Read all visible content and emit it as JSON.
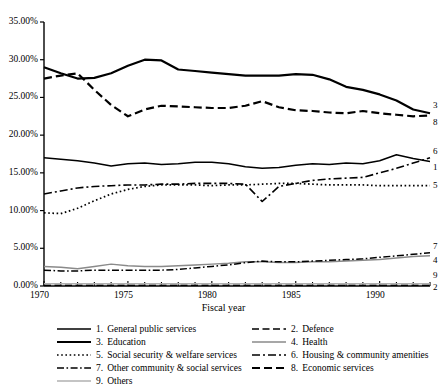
{
  "chart_data": {
    "type": "line",
    "title": "",
    "xlabel": "Fiscal year",
    "ylabel": "",
    "x": [
      1970,
      1971,
      1972,
      1973,
      1974,
      1975,
      1976,
      1977,
      1978,
      1979,
      1980,
      1981,
      1982,
      1983,
      1984,
      1985,
      1986,
      1987,
      1988,
      1989,
      1990,
      1991,
      1992,
      1993
    ],
    "xlim": [
      1970,
      1993
    ],
    "ylim": [
      0,
      35
    ],
    "ytick_labels": [
      "0.00%",
      "5.00%",
      "10.00%",
      "15.00%",
      "20.00%",
      "25.00%",
      "30.00%",
      "35.00%"
    ],
    "ytick_values": [
      0,
      5,
      10,
      15,
      20,
      25,
      30,
      35
    ],
    "xtick_labels": [
      "1970",
      "1975",
      "1980",
      "1985",
      "1990"
    ],
    "xtick_values": [
      1970,
      1975,
      1980,
      1985,
      1990
    ],
    "grid": false,
    "legend_position": "below",
    "series": [
      {
        "name": "General public services",
        "number": "1",
        "style": "solid",
        "end_label": "1",
        "values": [
          17.0,
          16.8,
          16.6,
          16.3,
          15.9,
          16.2,
          16.3,
          16.1,
          16.2,
          16.4,
          16.4,
          16.2,
          15.8,
          15.6,
          15.7,
          16.0,
          16.2,
          16.1,
          16.3,
          16.2,
          16.6,
          17.4,
          16.9,
          16.5
        ]
      },
      {
        "name": "Defence",
        "number": "2",
        "style": "dashed",
        "end_label": "2",
        "values": [
          0.1,
          0.1,
          0.1,
          0.1,
          0.1,
          0.1,
          0.1,
          0.1,
          0.1,
          0.1,
          0.1,
          0.1,
          0.1,
          0.1,
          0.1,
          0.1,
          0.1,
          0.1,
          0.1,
          0.1,
          0.1,
          0.1,
          0.1,
          0.1
        ]
      },
      {
        "name": "Education",
        "number": "3",
        "style": "solid-thick",
        "end_label": "3",
        "values": [
          29.0,
          28.2,
          27.5,
          27.6,
          28.2,
          29.2,
          30.0,
          29.9,
          28.7,
          28.5,
          28.3,
          28.1,
          27.9,
          27.9,
          27.9,
          28.1,
          28.0,
          27.4,
          26.4,
          26.0,
          25.4,
          24.6,
          23.4,
          22.9
        ]
      },
      {
        "name": "Health",
        "number": "4",
        "style": "solid-grey",
        "end_label": "4",
        "values": [
          2.6,
          2.5,
          2.3,
          2.6,
          2.9,
          2.7,
          2.6,
          2.6,
          2.7,
          2.8,
          2.9,
          3.0,
          3.2,
          3.2,
          3.1,
          3.1,
          3.2,
          3.2,
          3.3,
          3.4,
          3.5,
          3.7,
          3.9,
          4.0
        ]
      },
      {
        "name": "Social security & welfare services",
        "number": "5",
        "style": "dotted",
        "end_label": "5",
        "values": [
          9.7,
          9.6,
          10.3,
          11.3,
          12.2,
          12.8,
          13.2,
          13.4,
          13.4,
          13.4,
          13.3,
          13.4,
          13.4,
          13.5,
          13.6,
          13.6,
          13.5,
          13.4,
          13.4,
          13.4,
          13.3,
          13.3,
          13.3,
          13.3
        ]
      },
      {
        "name": "Housing & community amenities",
        "number": "6",
        "style": "dash-dot",
        "end_label": "6",
        "values": [
          12.2,
          12.6,
          13.0,
          13.2,
          13.3,
          13.4,
          13.4,
          13.5,
          13.5,
          13.6,
          13.6,
          13.6,
          13.5,
          11.2,
          13.2,
          13.6,
          14.0,
          14.2,
          14.3,
          14.4,
          15.0,
          15.6,
          16.3,
          17.0
        ]
      },
      {
        "name": "Other community & social services",
        "number": "7",
        "style": "dash-dot-thin",
        "end_label": "7",
        "values": [
          2.1,
          2.0,
          2.0,
          2.1,
          2.1,
          2.1,
          2.1,
          2.1,
          2.2,
          2.4,
          2.6,
          2.8,
          3.1,
          3.3,
          3.2,
          3.2,
          3.3,
          3.4,
          3.5,
          3.6,
          3.8,
          4.0,
          4.2,
          4.4
        ]
      },
      {
        "name": "Economic services",
        "number": "8",
        "style": "dashed-thick",
        "end_label": "8",
        "values": [
          27.5,
          27.9,
          28.2,
          26.0,
          24.0,
          22.5,
          23.4,
          23.9,
          23.8,
          23.7,
          23.6,
          23.6,
          23.9,
          24.5,
          23.7,
          23.3,
          23.2,
          23.0,
          22.9,
          23.2,
          22.9,
          22.7,
          22.5,
          22.6
        ]
      },
      {
        "name": "Others",
        "number": "9",
        "style": "solid-light",
        "end_label": "9",
        "values": [
          0.3,
          0.3,
          0.3,
          0.3,
          0.3,
          0.3,
          0.3,
          0.3,
          0.3,
          0.3,
          0.3,
          0.3,
          0.3,
          0.3,
          0.3,
          0.3,
          0.3,
          0.3,
          0.3,
          0.3,
          0.3,
          0.3,
          0.3,
          0.3
        ]
      }
    ]
  },
  "legend": {
    "entries": [
      {
        "number": "1.",
        "label": "General public services",
        "style": "solid"
      },
      {
        "number": "2.",
        "label": "Defence",
        "style": "dashed"
      },
      {
        "number": "3.",
        "label": "Education",
        "style": "solid-thick"
      },
      {
        "number": "4.",
        "label": "Health",
        "style": "solid-grey"
      },
      {
        "number": "5.",
        "label": "Social security & welfare services",
        "style": "dotted"
      },
      {
        "number": "6.",
        "label": "Housing & community amenities",
        "style": "dash-dot"
      },
      {
        "number": "7.",
        "label": "Other community & social services",
        "style": "dash-dot-thin"
      },
      {
        "number": "8.",
        "label": "Economic services",
        "style": "dashed-thick"
      },
      {
        "number": "9.",
        "label": "Others",
        "style": "solid-light"
      }
    ]
  }
}
